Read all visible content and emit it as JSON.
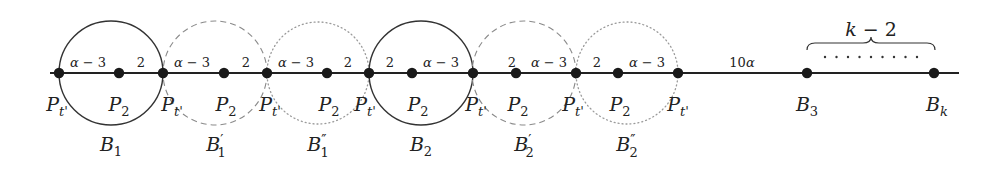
{
  "diagram": {
    "type": "weighted-path-with-blocks",
    "colors": {
      "line": "#222222",
      "solid_circle": "#333333",
      "dashed_circle": "#8a8a8a",
      "dotted_circle": "#9a9a9a",
      "node": "#1a1a1a"
    },
    "axis_y": 73,
    "line": {
      "x1": 50,
      "x2": 959
    },
    "nodes": [
      {
        "id": "n0",
        "x": 59,
        "label": "P",
        "sub": "t'",
        "label_x": 57
      },
      {
        "id": "n1",
        "x": 119,
        "label": "P",
        "sub": "2",
        "label_x": 119
      },
      {
        "id": "n2",
        "x": 163,
        "label": "P",
        "sub": "t'",
        "label_x": 172
      },
      {
        "id": "n3",
        "x": 224,
        "label": "P",
        "sub": "2",
        "label_x": 226
      },
      {
        "id": "n4",
        "x": 267,
        "label": "P",
        "sub": "t'",
        "label_x": 270
      },
      {
        "id": "n5",
        "x": 327,
        "label": "P",
        "sub": "2",
        "label_x": 329
      },
      {
        "id": "n6",
        "x": 369,
        "label": "P",
        "sub": "t'",
        "label_x": 365
      },
      {
        "id": "n7",
        "x": 412,
        "label": "P",
        "sub": "2",
        "label_x": 418
      },
      {
        "id": "n8",
        "x": 473,
        "label": "P",
        "sub": "t'",
        "label_x": 476
      },
      {
        "id": "n9",
        "x": 516,
        "label": "P",
        "sub": "2",
        "label_x": 518
      },
      {
        "id": "n10",
        "x": 576,
        "label": "P",
        "sub": "t'",
        "label_x": 573
      },
      {
        "id": "n11",
        "x": 618,
        "label": "P",
        "sub": "2",
        "label_x": 620
      },
      {
        "id": "n12",
        "x": 678,
        "label": "P",
        "sub": "t'",
        "label_x": 678
      },
      {
        "id": "n13",
        "x": 807,
        "label": "B",
        "sub": "3",
        "label_x": 807
      },
      {
        "id": "n14",
        "x": 934,
        "label": "B",
        "sub": "k",
        "label_x": 937
      }
    ],
    "edge_labels": [
      {
        "text": "α − 3",
        "x": 88
      },
      {
        "text": "2",
        "x": 141
      },
      {
        "text": "α − 3",
        "x": 192
      },
      {
        "text": "2",
        "x": 246
      },
      {
        "text": "α − 3",
        "x": 296
      },
      {
        "text": "2",
        "x": 348
      },
      {
        "text": "2",
        "x": 390
      },
      {
        "text": "α − 3",
        "x": 441
      },
      {
        "text": "2",
        "x": 512
      },
      {
        "text": "α − 3",
        "x": 549
      },
      {
        "text": "2",
        "x": 597
      },
      {
        "text": "α − 3",
        "x": 647
      },
      {
        "text": "10α",
        "x": 742
      }
    ],
    "blocks": [
      {
        "name": "B",
        "sub": "1",
        "prime": "",
        "cx": 111,
        "r": 52,
        "style": "solid",
        "label_x": 111
      },
      {
        "name": "B",
        "sub": "1",
        "prime": "′",
        "cx": 215,
        "r": 52,
        "style": "dashed",
        "label_x": 216
      },
      {
        "name": "B",
        "sub": "1",
        "prime": "″",
        "cx": 318,
        "r": 51,
        "style": "dotted",
        "label_x": 318
      },
      {
        "name": "B",
        "sub": "2",
        "prime": "",
        "cx": 421,
        "r": 52,
        "style": "solid",
        "label_x": 421
      },
      {
        "name": "B",
        "sub": "2",
        "prime": "′",
        "cx": 524,
        "r": 52,
        "style": "dashed",
        "label_x": 524
      },
      {
        "name": "B",
        "sub": "2",
        "prime": "″",
        "cx": 627,
        "r": 51,
        "style": "dotted",
        "label_x": 627
      }
    ],
    "brace": {
      "x1": 807,
      "x2": 935,
      "y": 43,
      "label": "k − 2",
      "label_y": 31,
      "dots_count": 9,
      "dots_x1": 825,
      "dots_x2": 917,
      "dots_y": 57
    }
  }
}
